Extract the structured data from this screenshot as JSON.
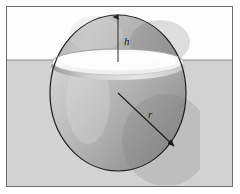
{
  "figure": {
    "background_color": "#ffffff",
    "frame": {
      "border_color": "#6d6d6d",
      "x": 6,
      "y": 6,
      "width": 227,
      "height": 181
    },
    "liquid": {
      "name": "liquid-region",
      "color": "#d2d2d2",
      "surface_line_color": "#8a8a8a",
      "surface_y": 60
    },
    "air": {
      "name": "air-region",
      "color": "#fdfdfd"
    },
    "sphere": {
      "name": "sphere",
      "center_x": 118,
      "center_y": 93,
      "radius_x": 68,
      "radius_y": 78,
      "outline_color": "#1d1d1d",
      "cap_fill_light": "#c9c9c9",
      "cap_fill_dark": "#8f8f8f",
      "body_fill_light": "#cfcfcf",
      "body_fill_dark": "#8c8c8c",
      "waterline_disc_color": "#fbfbfb",
      "waterline_disc_shadow": "#b9b9b9"
    },
    "labels": [
      {
        "id": "h",
        "name": "height-label-h",
        "text": "h",
        "x": 124,
        "y": 42,
        "description": "cap height above liquid surface"
      },
      {
        "id": "r",
        "name": "radius-label-r",
        "text": "r",
        "x": 151,
        "y": 116,
        "description": "sphere radius"
      }
    ],
    "annotations": {
      "height_arrow": {
        "name": "height-arrow",
        "x": 118,
        "y_top": 16,
        "y_bottom": 62,
        "color": "#2a2a2a",
        "arrow_at": "top"
      },
      "radius_arrow": {
        "name": "radius-arrow",
        "x1": 118,
        "y1": 93,
        "x2": 176,
        "y2": 148,
        "color": "#1d1d1d",
        "arrow_at": "end"
      }
    }
  }
}
